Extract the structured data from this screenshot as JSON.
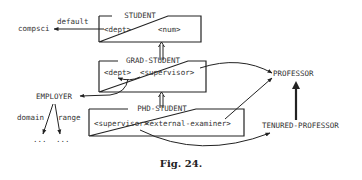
{
  "diagram": {
    "nodes": {
      "student": {
        "title": "STUDENT",
        "slots": [
          "<dept>",
          "<num>"
        ]
      },
      "grad_student": {
        "title": "GRAD-STUDENT",
        "slots": [
          "<dept>",
          "<supervisor>"
        ]
      },
      "phd_student": {
        "title": "PHD-STUDENT",
        "slots": [
          "<supervisor>",
          "<external-examiner>"
        ]
      },
      "professor": {
        "label": "PROFESSOR"
      },
      "tenured_professor": {
        "label": "TENURED-PROFESSOR"
      },
      "employer": {
        "label": "EMPLOYER"
      },
      "compsci": {
        "label": "compsci"
      },
      "domain_dots": {
        "label": "..."
      },
      "range_dots": {
        "label": "..."
      }
    },
    "edge_labels": {
      "default": "default",
      "domain": "domain",
      "range": "range"
    },
    "edges": [
      {
        "from": "student.<dept>",
        "to": "compsci",
        "label": "default"
      },
      {
        "from": "grad_student",
        "to": "student",
        "type": "is-a"
      },
      {
        "from": "phd_student",
        "to": "grad_student",
        "type": "is-a"
      },
      {
        "from": "grad_student.<supervisor>",
        "to": "professor"
      },
      {
        "from": "grad_student.<supervisor>",
        "to": "grad_student.<dept>"
      },
      {
        "from": "grad_student.<dept>",
        "to": "employer"
      },
      {
        "from": "phd_student.<external-examiner>",
        "to": "professor"
      },
      {
        "from": "phd_student.<supervisor>",
        "to": "tenured_professor"
      },
      {
        "from": "tenured_professor",
        "to": "professor",
        "type": "is-a"
      },
      {
        "from": "employer",
        "to": "domain_dots",
        "label": "domain"
      },
      {
        "from": "employer",
        "to": "range_dots",
        "label": "range"
      }
    ]
  },
  "caption": "Fig. 24."
}
